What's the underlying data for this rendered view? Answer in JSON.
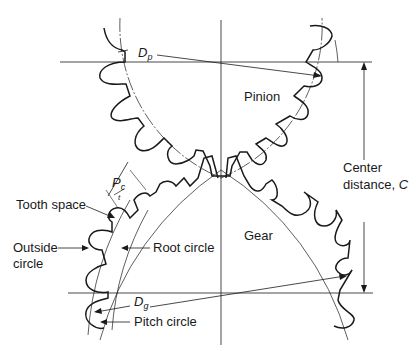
{
  "diagram": {
    "labels": {
      "pitch_diameter_pinion": "D",
      "pitch_diameter_pinion_sub": "p",
      "pinion": "Pinion",
      "center_distance_line1": "Center",
      "center_distance_line2": "distance, ",
      "center_distance_symbol": "C",
      "circular_pitch": "P",
      "circular_pitch_sub": "c",
      "tooth_thickness": "t",
      "tooth_space": "Tooth space",
      "outside_circle_line1": "Outside",
      "outside_circle_line2": "circle",
      "root_circle": "Root circle",
      "gear": "Gear",
      "pitch_diameter_gear": "D",
      "pitch_diameter_gear_sub": "g",
      "pitch_circle": "Pitch circle"
    },
    "colors": {
      "line": "#1a1a1a",
      "thin": "#333333",
      "background": "#ffffff"
    }
  }
}
